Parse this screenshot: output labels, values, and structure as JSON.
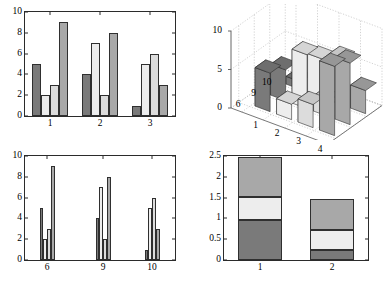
{
  "figure": {
    "background": "#ffffff",
    "axis_color": "#2b2b2b",
    "caption": ""
  },
  "palette": {
    "dark": "#7a7a7a",
    "light": "#ededed",
    "medium_light": "#dcdcdc",
    "medium": "#a8a8a8",
    "edge": "#2f2f2f",
    "grid": "#b4b4b4"
  },
  "panels": {
    "top_left": {
      "name": "grouped-bar-chart-top-left"
    },
    "top_right": {
      "name": "bar3-chart"
    },
    "bottom_left": {
      "name": "grouped-bar-chart-bottom-left"
    },
    "bottom_right": {
      "name": "stacked-bar-chart"
    }
  },
  "chart_data": [
    {
      "id": "top-left",
      "type": "bar",
      "grouping": "grouped",
      "title": "",
      "xlabel": "",
      "ylabel": "",
      "categories": [
        "1",
        "2",
        "3"
      ],
      "xticklabels": [
        "1",
        "2",
        "3"
      ],
      "yticklabels": [
        "0",
        "2",
        "4",
        "6",
        "8",
        "10"
      ],
      "yticks": [
        0,
        2,
        4,
        6,
        8,
        10
      ],
      "ylim": [
        0,
        10
      ],
      "grid": false,
      "legend": "none",
      "series": [
        {
          "name": "series1",
          "color": "#7a7a7a",
          "values": [
            5,
            4,
            1
          ]
        },
        {
          "name": "series2",
          "color": "#ededed",
          "values": [
            2,
            7,
            5
          ]
        },
        {
          "name": "series3",
          "color": "#dcdcdc",
          "values": [
            3,
            2,
            6
          ]
        },
        {
          "name": "series4",
          "color": "#a8a8a8",
          "values": [
            9,
            8,
            3
          ]
        }
      ]
    },
    {
      "id": "top-right",
      "type": "bar",
      "grouping": "3d",
      "title": "",
      "xlabel": "",
      "ylabel": "",
      "zticklabels": [
        "0",
        "5",
        "10"
      ],
      "zticks": [
        0,
        5,
        10
      ],
      "zlim": [
        0,
        10
      ],
      "xticklabels": [
        "1",
        "2",
        "3",
        "4"
      ],
      "yticklabels": [
        "6",
        "9",
        "10"
      ],
      "grid": true,
      "legend": "none",
      "rows": [
        "6",
        "9",
        "10"
      ],
      "columns": [
        "1",
        "2",
        "3",
        "4"
      ],
      "values": [
        [
          5,
          2,
          3,
          9
        ],
        [
          4,
          7,
          2,
          8
        ],
        [
          1,
          5,
          6,
          3
        ]
      ]
    },
    {
      "id": "bottom-left",
      "type": "bar",
      "grouping": "grouped",
      "title": "",
      "xlabel": "",
      "ylabel": "",
      "categories": [
        "6",
        "9",
        "10"
      ],
      "xticklabels": [
        "6",
        "9",
        "10"
      ],
      "yticklabels": [
        "0",
        "2",
        "4",
        "6",
        "8",
        "10"
      ],
      "yticks": [
        0,
        2,
        4,
        6,
        8,
        10
      ],
      "ylim": [
        0,
        10
      ],
      "grid": false,
      "legend": "none",
      "series": [
        {
          "name": "series1",
          "color": "#7a7a7a",
          "values": [
            5,
            4,
            1
          ]
        },
        {
          "name": "series2",
          "color": "#ededed",
          "values": [
            2,
            7,
            5
          ]
        },
        {
          "name": "series3",
          "color": "#dcdcdc",
          "values": [
            3,
            2,
            6
          ]
        },
        {
          "name": "series4",
          "color": "#a8a8a8",
          "values": [
            9,
            8,
            3
          ]
        }
      ]
    },
    {
      "id": "bottom-right",
      "type": "bar",
      "grouping": "stacked",
      "title": "",
      "xlabel": "",
      "ylabel": "",
      "categories": [
        "1",
        "2"
      ],
      "xticklabels": [
        "1",
        "2"
      ],
      "yticklabels": [
        "0",
        "0.5",
        "1",
        "1.5",
        "2",
        "2.5"
      ],
      "yticks": [
        0,
        0.5,
        1,
        1.5,
        2,
        2.5
      ],
      "ylim": [
        0,
        2.5
      ],
      "grid": false,
      "legend": "none",
      "series": [
        {
          "name": "segment1",
          "color": "#7a7a7a",
          "values": [
            0.95,
            0.23
          ]
        },
        {
          "name": "segment2",
          "color": "#ededed",
          "values": [
            0.57,
            0.49
          ]
        },
        {
          "name": "segment3",
          "color": "#a8a8a8",
          "values": [
            0.95,
            0.75
          ]
        }
      ],
      "cumulative_tops": [
        [
          0.95,
          1.52,
          2.47
        ],
        [
          0.23,
          0.72,
          1.47
        ]
      ]
    }
  ]
}
